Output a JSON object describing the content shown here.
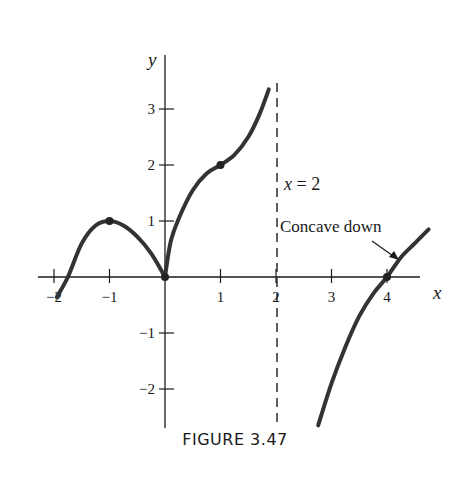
{
  "chart_data": {
    "type": "line",
    "title": "",
    "caption": "FIGURE 3.47",
    "xlabel": "x",
    "ylabel": "y",
    "xlim": [
      -2.2,
      4.8
    ],
    "ylim": [
      -2.7,
      3.6
    ],
    "grid": false,
    "x_ticks": [
      -2,
      -1,
      1,
      2,
      3,
      4
    ],
    "x_tick_labels": [
      "−2",
      "−1",
      "1",
      "2",
      "3",
      "4"
    ],
    "y_ticks": [
      -2,
      -1,
      1,
      2,
      3
    ],
    "y_tick_labels": [
      "−2",
      "−1",
      "1",
      "2",
      "3"
    ],
    "series": [
      {
        "name": "left branch (concave down, x<0)",
        "points": [
          [
            -1.95,
            -0.36
          ],
          [
            -1.75,
            0
          ],
          [
            -1.5,
            0.6
          ],
          [
            -1.25,
            0.92
          ],
          [
            -1,
            1
          ],
          [
            -0.75,
            0.92
          ],
          [
            -0.5,
            0.72
          ],
          [
            -0.25,
            0.42
          ],
          [
            0,
            0
          ]
        ]
      },
      {
        "name": "middle branch (0<x<2)",
        "points": [
          [
            0,
            0
          ],
          [
            0.1,
            0.62
          ],
          [
            0.25,
            1.05
          ],
          [
            0.5,
            1.55
          ],
          [
            0.75,
            1.85
          ],
          [
            1,
            2
          ],
          [
            1.25,
            2.18
          ],
          [
            1.5,
            2.5
          ],
          [
            1.7,
            2.9
          ],
          [
            1.87,
            3.35
          ]
        ]
      },
      {
        "name": "right branch (x>2)",
        "points": [
          [
            2.76,
            -2.65
          ],
          [
            3,
            -1.9
          ],
          [
            3.25,
            -1.25
          ],
          [
            3.5,
            -0.7
          ],
          [
            3.75,
            -0.3
          ],
          [
            4,
            0
          ],
          [
            4.25,
            0.35
          ],
          [
            4.5,
            0.6
          ],
          [
            4.75,
            0.85
          ]
        ]
      }
    ],
    "marked_points": [
      [
        -1,
        1
      ],
      [
        0,
        0
      ],
      [
        1,
        2
      ],
      [
        4,
        0
      ]
    ],
    "asymptote": {
      "x": 2,
      "style": "dashed",
      "label": "x = 2"
    },
    "annotations": [
      {
        "text": "x = 2",
        "at": [
          2.1,
          1.6
        ]
      },
      {
        "text": "Concave down",
        "at": [
          2.1,
          0.85
        ],
        "arrow_to": [
          4.2,
          0.25
        ]
      }
    ]
  },
  "labels": {
    "x_axis": "x",
    "y_axis": "y",
    "asymptote": "x = 2",
    "concave": "Concave down",
    "caption": "FIGURE 3.47"
  }
}
